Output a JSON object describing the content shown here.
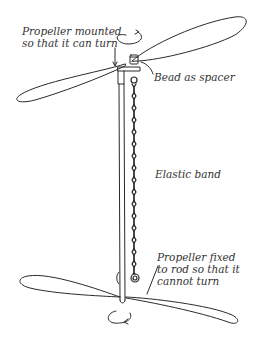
{
  "diagram": {
    "title": "",
    "labels": {
      "top_propeller": [
        "Propeller mounted",
        "so that it can turn"
      ],
      "bead": "Bead as spacer",
      "elastic": "Elastic band",
      "bottom_propeller": [
        "Propeller fixed",
        "to rod so that it",
        "cannot turn"
      ]
    },
    "colors": {
      "stroke": "#2a2a2a",
      "text": "#333333",
      "background": "#ffffff"
    }
  }
}
